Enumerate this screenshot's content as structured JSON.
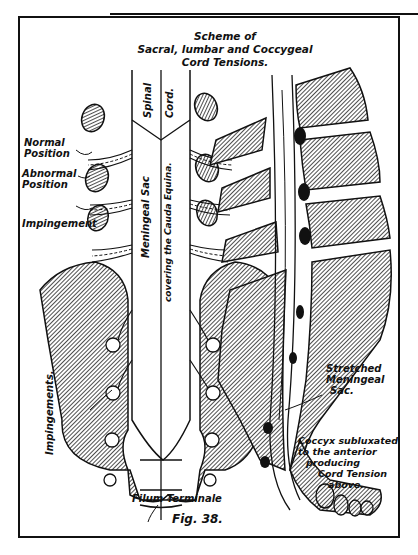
{
  "figure": {
    "title_lines": [
      "Scheme of",
      "Sacral, lumbar and Coccygeal",
      "Cord Tensions."
    ],
    "caption": "Fig. 38.",
    "left_view": {
      "labels": {
        "normal_position": [
          "Normal",
          "Position"
        ],
        "abnormal_position": [
          "Abnormal",
          "Position"
        ],
        "impingement": "Impingement",
        "impingements": "Impingements.",
        "spinal": "Spinal",
        "cord": "Cord.",
        "meningeal_sac": "Meningeal Sac",
        "covering": "covering the Cauda Equina.",
        "filum_terminale": "Filum Terminale"
      }
    },
    "right_view": {
      "labels": {
        "stretched_meningeal_sac": [
          "Stretched",
          "Meningeal",
          "Sac."
        ],
        "coccyx_note": [
          "Coccyx subluxated",
          "to the anterior",
          "producing",
          "Cord Tension",
          "above."
        ]
      }
    },
    "colors": {
      "ink": "#111111",
      "paper": "#ffffff",
      "hatch": "#555555"
    }
  }
}
